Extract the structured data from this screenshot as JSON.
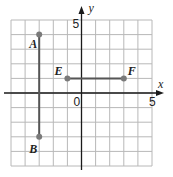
{
  "chart_data": {
    "type": "scatter",
    "title": "",
    "xlabel": "x",
    "ylabel": "y",
    "xlim": [
      -5,
      5
    ],
    "ylim": [
      -5,
      5
    ],
    "grid": true,
    "tick_labels": {
      "origin": "0",
      "x_max": "5",
      "y_max": "5"
    },
    "points": [
      {
        "label": "A",
        "x": -3,
        "y": 4
      },
      {
        "label": "B",
        "x": -3,
        "y": -3
      },
      {
        "label": "E",
        "x": -1,
        "y": 1
      },
      {
        "label": "F",
        "x": 3,
        "y": 1
      }
    ],
    "segments": [
      {
        "from": "A",
        "to": "B"
      },
      {
        "from": "E",
        "to": "F"
      }
    ]
  },
  "colors": {
    "grid": "#b8b8b8",
    "axis": "#1a1a1a",
    "segment": "#555555",
    "point": "#7a7a7a"
  }
}
